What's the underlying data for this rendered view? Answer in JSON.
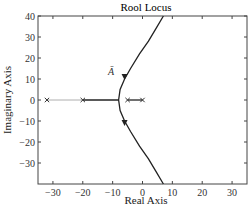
{
  "chart_data": {
    "type": "line",
    "title": "Rool  Locus",
    "xlabel": "Real Axis",
    "ylabel": "Imaginary Axis",
    "xlim": [
      -35,
      35
    ],
    "ylim": [
      -40,
      40
    ],
    "xticks": [
      -30,
      -20,
      -10,
      0,
      10,
      20,
      30
    ],
    "yticks": [
      40,
      30,
      20,
      10,
      0,
      -10,
      -20,
      -30
    ],
    "grid": false,
    "poles": [
      [
        -32,
        0
      ],
      [
        -20,
        0
      ],
      [
        -5,
        0
      ],
      [
        0,
        0
      ]
    ],
    "annotation": "Ā",
    "series": [
      {
        "name": "upper-branch",
        "x": [
          -8,
          -7.5,
          -6,
          -4,
          -1,
          2,
          4.5,
          7
        ],
        "y": [
          0,
          5,
          10,
          15,
          22,
          28,
          34,
          40
        ]
      },
      {
        "name": "lower-branch",
        "x": [
          -8,
          -7.5,
          -6,
          -4,
          -1,
          2,
          4.5,
          7
        ],
        "y": [
          0,
          -5,
          -10,
          -15,
          -22,
          -28,
          -34,
          -40
        ]
      },
      {
        "name": "real-axis-segment-1",
        "x": [
          -32,
          -20
        ],
        "y": [
          0,
          0
        ]
      },
      {
        "name": "real-axis-segment-2",
        "x": [
          -20,
          -8
        ],
        "y": [
          0,
          0
        ]
      },
      {
        "name": "real-axis-segment-3",
        "x": [
          -5,
          0
        ],
        "y": [
          0,
          0
        ]
      }
    ],
    "arrows": [
      [
        -6,
        11
      ],
      [
        -6,
        -11
      ]
    ]
  }
}
